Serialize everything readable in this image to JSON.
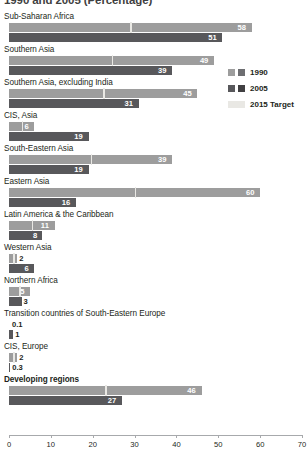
{
  "chart_data": {
    "type": "bar",
    "title": "1990 and 2005 (Percentage)",
    "xlabel": "",
    "ylabel": "",
    "xlim": [
      0,
      70
    ],
    "grid": false,
    "orientation": "horizontal",
    "legend_position": "right",
    "categories": [
      "Sub-Saharan Africa",
      "Southern Asia",
      "Southern Asia, excluding India",
      "CIS, Asia",
      "South-Eastern Asia",
      "Eastern Asia",
      "Latin America & the Caribbean",
      "Western Asia",
      "Northern Africa",
      "Transition countries of South-Eastern Europe",
      "CIS, Europe",
      "Developing regions"
    ],
    "series": [
      {
        "name": "1990",
        "color": "#9d9d9d",
        "values": [
          58,
          49,
          45,
          6,
          39,
          60,
          11,
          2,
          5,
          0.1,
          2,
          46
        ]
      },
      {
        "name": "2005",
        "color": "#58585b",
        "values": [
          51,
          39,
          31,
          19,
          19,
          16,
          8,
          6,
          3,
          1,
          0.3,
          27
        ]
      },
      {
        "name": "2015 Target",
        "color": "#e9e8e4",
        "values": [
          29,
          24.5,
          22.5,
          3,
          19.5,
          30,
          5.5,
          1,
          2.5,
          0.05,
          1,
          23
        ]
      }
    ],
    "ticks": [
      0,
      10,
      20,
      30,
      40,
      50,
      60,
      70
    ],
    "tick_labels": [
      "0",
      "10",
      "20",
      "30",
      "40",
      "50",
      "60",
      "70"
    ],
    "value_labels": {
      "1990": [
        "58",
        "49",
        "45",
        "6",
        "39",
        "60",
        "11",
        "2",
        "5",
        "0.1",
        "2",
        "46"
      ],
      "2005": [
        "51",
        "39",
        "31",
        "19",
        "19",
        "16",
        "8",
        "6",
        "3",
        "1",
        "0.3",
        "27"
      ]
    },
    "bold_categories": [
      "Developing regions"
    ]
  },
  "legend": {
    "items": [
      {
        "label": "1990"
      },
      {
        "label": "2005"
      },
      {
        "label": "2015 Target"
      }
    ]
  }
}
